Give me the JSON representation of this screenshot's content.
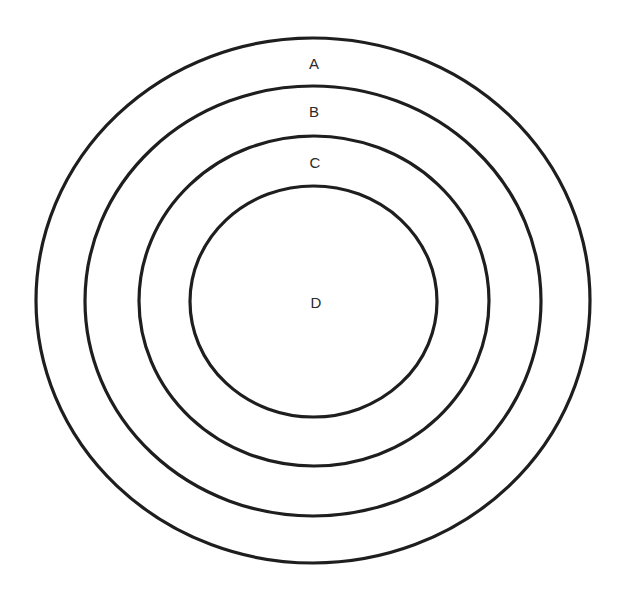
{
  "diagram": {
    "type": "concentric-circles",
    "stroke_color": "#1e1e1e",
    "background": "#ffffff",
    "rings": [
      {
        "label": "A",
        "cx": 313,
        "cy": 300.5,
        "rx": 277,
        "ry": 262.5,
        "label_x": 314,
        "label_y": 69
      },
      {
        "label": "B",
        "cx": 313,
        "cy": 301,
        "rx": 228,
        "ry": 215,
        "label_x": 314,
        "label_y": 117
      },
      {
        "label": "C",
        "cx": 314,
        "cy": 301,
        "rx": 175,
        "ry": 165,
        "label_x": 315,
        "label_y": 168
      },
      {
        "label": "D",
        "cx": 313.5,
        "cy": 301.5,
        "rx": 123.5,
        "ry": 115.5,
        "label_x": 316,
        "label_y": 308
      }
    ]
  }
}
